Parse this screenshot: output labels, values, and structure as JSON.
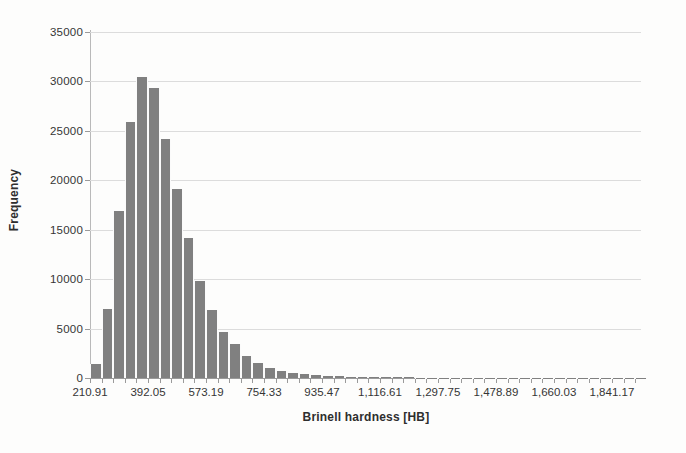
{
  "chart_data": {
    "type": "bar",
    "title": "",
    "subtitle": "",
    "xlabel": "Brinell hardness [HB]",
    "ylabel": "Frequency",
    "grid": true,
    "legend": "none",
    "ylim": [
      0,
      35000
    ],
    "y_ticks": [
      0,
      5000,
      10000,
      15000,
      20000,
      25000,
      30000,
      35000
    ],
    "y_tick_labels": [
      "0",
      "5000",
      "10000",
      "15000",
      "20000",
      "25000",
      "30000",
      "35000"
    ],
    "xlim": [
      210.91,
      1932.0
    ],
    "x_tick_labels": [
      "210.91",
      "392.05",
      "573.19",
      "754.33",
      "935.47",
      "1,116.61",
      "1,297.75",
      "1,478.89",
      "1,660.03",
      "1,841.17"
    ],
    "x_tick_values": [
      210.91,
      392.05,
      573.19,
      754.33,
      935.47,
      1116.61,
      1297.75,
      1478.89,
      1660.03,
      1841.17
    ],
    "bin_width": 36.23,
    "bar_color": "#808080",
    "categories": [
      "210.91",
      "247.14",
      "283.37",
      "319.60",
      "355.83",
      "392.05",
      "428.28",
      "464.51",
      "500.74",
      "536.97",
      "573.19",
      "609.42",
      "645.65",
      "681.88",
      "718.11",
      "754.33",
      "790.56",
      "826.79",
      "863.02",
      "899.25",
      "935.47",
      "971.70",
      "1,007.93",
      "1,044.16",
      "1,080.39",
      "1,116.61",
      "1,152.84",
      "1,189.07",
      "1,225.30",
      "1,261.53",
      "1,297.75",
      "1,333.98",
      "1,370.21",
      "1,406.44",
      "1,442.67",
      "1,478.89",
      "1,515.12",
      "1,551.35",
      "1,587.58",
      "1,623.81",
      "1,660.03",
      "1,696.26",
      "1,732.49",
      "1,768.72",
      "1,804.95",
      "1,841.17",
      "1,877.40",
      "1,913.63"
    ],
    "values": [
      1400,
      6950,
      16900,
      25900,
      30500,
      29300,
      24200,
      19100,
      14200,
      9850,
      6900,
      4700,
      3400,
      2200,
      1500,
      1000,
      750,
      520,
      380,
      300,
      230,
      180,
      150,
      120,
      100,
      80,
      70,
      60,
      50,
      45,
      40,
      35,
      30,
      28,
      25,
      22,
      20,
      18,
      15,
      13,
      11,
      10,
      9,
      8,
      7,
      6,
      5,
      4
    ]
  }
}
